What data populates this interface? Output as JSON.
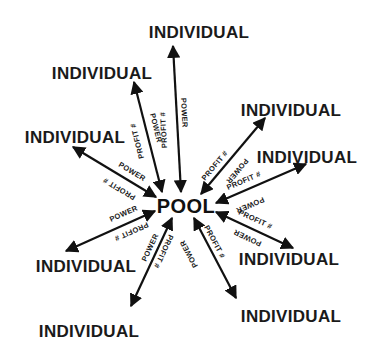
{
  "diagram": {
    "type": "hub-and-spoke",
    "hub": {
      "label": "POOL",
      "x": 186,
      "y": 212
    },
    "edge_labels": {
      "outbound": "PROFIT #",
      "inbound": "POWER"
    },
    "colors": {
      "ink": "#111111",
      "background": "#ffffff"
    },
    "nodes": [
      {
        "id": "top",
        "label": "INDIVIDUAL",
        "x": 199,
        "y": 37
      },
      {
        "id": "upper-left",
        "label": "INDIVIDUAL",
        "x": 102,
        "y": 78
      },
      {
        "id": "left",
        "label": "INDIVIDUAL",
        "x": 75,
        "y": 142
      },
      {
        "id": "upper-right",
        "label": "INDIVIDUAL",
        "x": 291,
        "y": 115
      },
      {
        "id": "right",
        "label": "INDIVIDUAL",
        "x": 307,
        "y": 162
      },
      {
        "id": "lower-left",
        "label": "INDIVIDUAL",
        "x": 86,
        "y": 271
      },
      {
        "id": "lower-right",
        "label": "INDIVIDUAL",
        "x": 289,
        "y": 264
      },
      {
        "id": "bottom-left",
        "label": "INDIVIDUAL",
        "x": 89,
        "y": 336
      },
      {
        "id": "bottom-right",
        "label": "INDIVIDUAL",
        "x": 291,
        "y": 321
      }
    ],
    "edges": [
      {
        "to": "top",
        "label_a": "PROFIT #",
        "label_b": "POWER",
        "bidirectional": true
      },
      {
        "to": "upper-left",
        "label_a": "PROFIT #",
        "label_b": "POWER",
        "bidirectional": true
      },
      {
        "to": "left",
        "label_a": "PROFIT #",
        "label_b": "POWER",
        "bidirectional": true
      },
      {
        "to": "upper-right",
        "label_a": "PROFIT #",
        "label_b": "POWER",
        "bidirectional": true
      },
      {
        "to": "right",
        "label_a": "PROFIT #",
        "label_b": "POWER",
        "bidirectional": true
      },
      {
        "to": "lower-left",
        "label_a": "PROFIT #",
        "label_b": "POWER",
        "bidirectional": true
      },
      {
        "to": "lower-right",
        "label_a": "PROFIT #",
        "label_b": "POWER",
        "bidirectional": true
      },
      {
        "to": "bottom-left",
        "label_a": "PROFIT #",
        "label_b": "POWER",
        "bidirectional": true
      },
      {
        "to": "bottom-right",
        "label_a": "PROFIT #",
        "label_b": "POWER",
        "bidirectional": true
      }
    ]
  }
}
